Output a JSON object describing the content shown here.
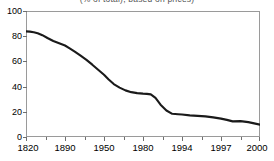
{
  "chart_data": {
    "type": "line",
    "title": "(% of total), based on prices)",
    "subtitle": "",
    "xlabel": "",
    "ylabel": "",
    "ylim": [
      0,
      100
    ],
    "yticks": [
      0,
      20,
      40,
      60,
      80,
      100
    ],
    "ytick_labels": [
      "0",
      "20",
      "40",
      "60",
      "80",
      "100"
    ],
    "categories": [
      "1820",
      "1890",
      "1950",
      "1980",
      "1994",
      "1997",
      "2000"
    ],
    "category_positions": [
      0,
      1,
      2,
      3,
      4,
      5,
      6
    ],
    "grid": false,
    "legend": null,
    "legend_position": "none",
    "line_color": "#1a1a1a",
    "line_width": 2.1,
    "frame_color": "#9a9a9a",
    "series": [
      {
        "name": "share",
        "x": [
          0.0,
          0.1,
          0.2,
          0.3,
          0.42,
          0.55,
          0.7,
          0.85,
          1.0,
          1.12,
          1.25,
          1.4,
          1.55,
          1.7,
          1.85,
          2.0,
          2.12,
          2.25,
          2.4,
          2.55,
          2.7,
          2.85,
          3.0,
          3.1,
          3.2,
          3.32,
          3.45,
          3.6,
          3.75,
          3.9,
          4.0,
          4.2,
          4.4,
          4.6,
          4.8,
          5.0,
          5.15,
          5.3,
          5.5,
          5.7,
          5.85,
          6.0
        ],
        "values": [
          83.8,
          83.6,
          83.2,
          82.4,
          80.8,
          78.6,
          76.2,
          74.4,
          72.6,
          70.4,
          67.8,
          64.6,
          61.2,
          57.4,
          53.4,
          49.4,
          45.6,
          42.0,
          39.2,
          37.0,
          35.6,
          34.8,
          34.4,
          34.2,
          33.8,
          31.0,
          25.6,
          21.0,
          18.4,
          18.0,
          17.8,
          17.2,
          16.8,
          16.4,
          15.6,
          14.6,
          13.6,
          12.4,
          12.6,
          11.8,
          10.8,
          9.8
        ]
      }
    ],
    "annotations": [
      {
        "label": "peak-plateau",
        "x": "1820",
        "value": 84
      },
      {
        "label": "step-down",
        "x": "1980",
        "value": 34
      },
      {
        "label": "end-value",
        "x": "2000",
        "value": 10
      }
    ]
  }
}
